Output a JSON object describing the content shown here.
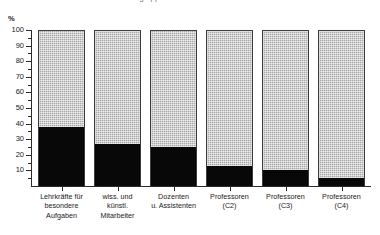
{
  "clipped_title": "Frauenanteile an den Personalgruppen an Hochschulen",
  "axis": {
    "unit_label": "%",
    "y_ticks": [
      "100",
      "90",
      "80",
      "70",
      "60",
      "50",
      "40",
      "30",
      "20",
      "10"
    ]
  },
  "chart_data": {
    "type": "bar",
    "stacked": true,
    "normalized_percent": true,
    "title": "",
    "subtitle": "",
    "xlabel": "",
    "ylabel": "%",
    "ylim": [
      0,
      100
    ],
    "ytick_step": 10,
    "grid": false,
    "legend_position": "none",
    "categories": [
      "Lehrkräfte für besondere Aufgaben",
      "wiss. und künstl. Mitarbeiter",
      "Dozenten u. Assistenten",
      "Professoren (C2)",
      "Professoren (C3)",
      "Professoren (C4)"
    ],
    "category_lines": [
      [
        "Lehrkräfte für",
        "besondere",
        "Aufgaben"
      ],
      [
        "wiss. und",
        "künstl.",
        "Mitarbeiter"
      ],
      [
        "Dozenten",
        "u. Assistenten"
      ],
      [
        "Professoren",
        "(C2)"
      ],
      [
        "Professoren",
        "(C3)"
      ],
      [
        "Professoren",
        "(C4)"
      ]
    ],
    "series": [
      {
        "name": "unterer Anteil (schwarz)",
        "color": "#080808",
        "values": [
          38,
          27,
          25,
          13,
          10,
          5
        ]
      },
      {
        "name": "oberer Anteil (grau)",
        "color": "#a8a8a8",
        "values": [
          62,
          73,
          75,
          87,
          90,
          95
        ]
      }
    ]
  },
  "colors": {
    "lower_segment": "#080808",
    "upper_segment": "#a8a8a8",
    "axis": "#2b2b2b",
    "background": "#ffffff"
  }
}
